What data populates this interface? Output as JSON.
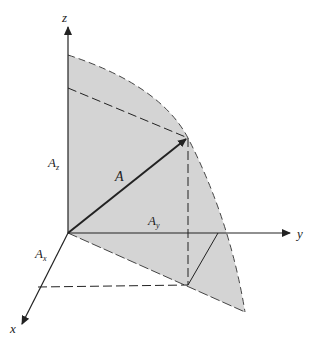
{
  "diagram": {
    "axes": {
      "x_label": "x",
      "y_label": "y",
      "z_label": "z"
    },
    "vector": {
      "label": "A"
    },
    "components": {
      "x": {
        "base": "A",
        "sub": "x"
      },
      "y": {
        "base": "A",
        "sub": "y"
      },
      "z": {
        "base": "A",
        "sub": "z"
      }
    },
    "colors": {
      "shade": "#d4d4d4",
      "line": "#222222"
    }
  }
}
